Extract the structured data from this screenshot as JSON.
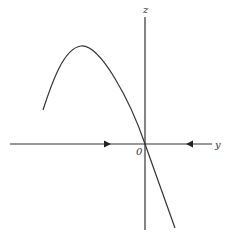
{
  "diagram": {
    "axes": {
      "vertical_label": "z",
      "horizontal_label": "y",
      "origin_label": "0"
    },
    "curve": {
      "description": "Parabolic curve rising to a maximum on the left, passing through the origin and descending steeply to the lower right"
    },
    "arrows": [
      {
        "position": "left of origin on y-axis",
        "direction": "right"
      },
      {
        "position": "right of origin on y-axis",
        "direction": "left"
      }
    ],
    "colors": {
      "stroke": "#333333",
      "background": "#ffffff"
    }
  }
}
